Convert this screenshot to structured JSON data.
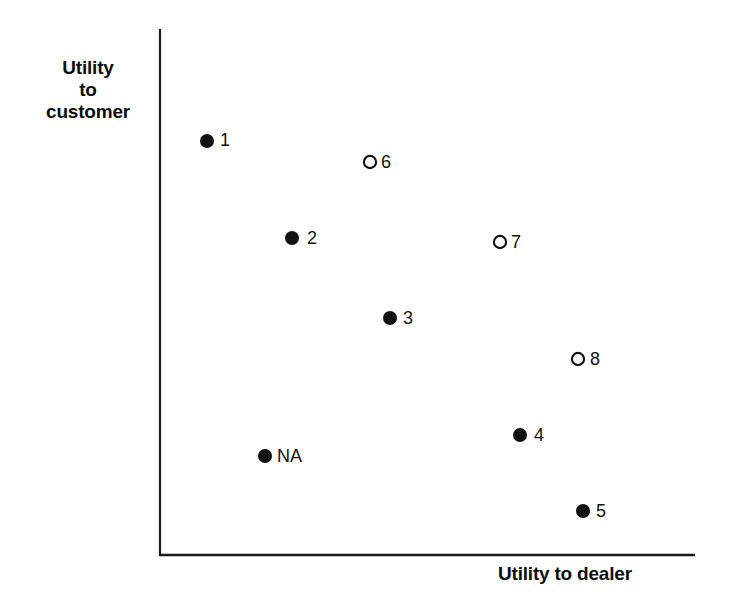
{
  "figure": {
    "background_color": "#ffffff",
    "axis_color": "#1a1a1a",
    "marker_color": "#111111"
  },
  "axes": {
    "y_label_line1": "Utility",
    "y_label_line2": "to",
    "y_label_line3": "customer",
    "x_label": "Utility to dealer"
  },
  "chart_data": {
    "type": "scatter",
    "title": "",
    "xlabel": "Utility to dealer",
    "ylabel": "Utility to customer",
    "grid": false,
    "legend": "none",
    "axis_ticks": "none",
    "axis_scale": "unlabeled ordinal / qualitative",
    "xlim": [
      0,
      100
    ],
    "ylim": [
      0,
      100
    ],
    "series": [
      {
        "name": "filled",
        "marker": "filled-circle",
        "points": [
          {
            "label": "1",
            "x": 8.8,
            "y": 78.7
          },
          {
            "label": "2",
            "x": 24.7,
            "y": 60.3
          },
          {
            "label": "3",
            "x": 43.0,
            "y": 45.1
          },
          {
            "label": "4",
            "x": 67.3,
            "y": 22.8
          },
          {
            "label": "5",
            "x": 79.1,
            "y": 8.4
          },
          {
            "label": "NA",
            "x": 19.6,
            "y": 18.8
          }
        ]
      },
      {
        "name": "open",
        "marker": "open-circle",
        "points": [
          {
            "label": "6",
            "x": 39.3,
            "y": 74.7
          },
          {
            "label": "7",
            "x": 63.6,
            "y": 59.5
          },
          {
            "label": "8",
            "x": 78.1,
            "y": 37.3
          }
        ]
      }
    ]
  },
  "markers": [
    {
      "id": "1",
      "type": "filled",
      "cx": 207,
      "cy": 141,
      "r": 7.0,
      "label": "1",
      "lx": 220,
      "ly": 141
    },
    {
      "id": "6",
      "type": "open",
      "cx": 370,
      "cy": 162,
      "r": 7.0,
      "label": "6",
      "lx": 381,
      "ly": 163
    },
    {
      "id": "2",
      "type": "filled",
      "cx": 292,
      "cy": 238,
      "r": 7.0,
      "label": "2",
      "lx": 307,
      "ly": 239
    },
    {
      "id": "7",
      "type": "open",
      "cx": 500,
      "cy": 242,
      "r": 7.0,
      "label": "7",
      "lx": 511,
      "ly": 243
    },
    {
      "id": "3",
      "type": "filled",
      "cx": 390,
      "cy": 318,
      "r": 7.0,
      "label": "3",
      "lx": 403,
      "ly": 319
    },
    {
      "id": "8",
      "type": "open",
      "cx": 578,
      "cy": 359,
      "r": 7.0,
      "label": "8",
      "lx": 590,
      "ly": 360
    },
    {
      "id": "4",
      "type": "filled",
      "cx": 520,
      "cy": 435,
      "r": 7.0,
      "label": "4",
      "lx": 534,
      "ly": 436
    },
    {
      "id": "NA",
      "type": "filled",
      "cx": 265,
      "cy": 456,
      "r": 7.0,
      "label": "NA",
      "lx": 277,
      "ly": 457
    },
    {
      "id": "5",
      "type": "filled",
      "cx": 583,
      "cy": 511,
      "r": 7.0,
      "label": "5",
      "lx": 596,
      "ly": 512
    }
  ],
  "geometry": {
    "y_axis_x": 160,
    "y_axis_top": 29,
    "y_axis_bottom": 556,
    "x_axis_y": 555,
    "x_axis_left": 159,
    "x_axis_right": 695
  }
}
